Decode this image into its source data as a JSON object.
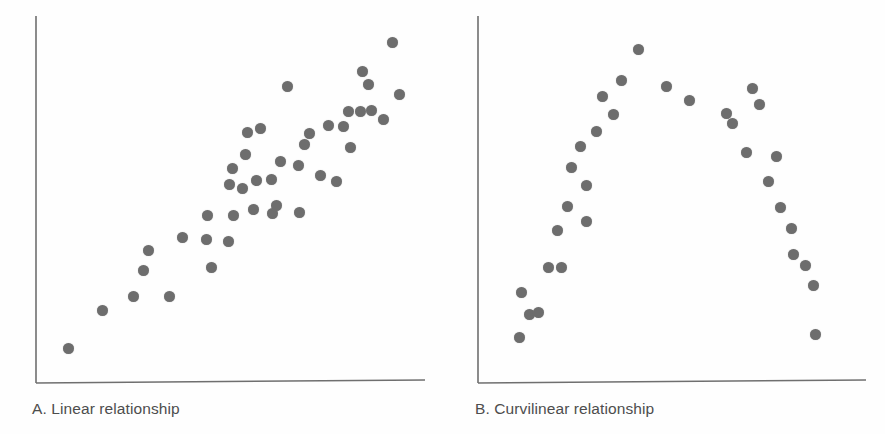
{
  "figure": {
    "background_color": "#fefefe",
    "dot_color": "#6d6d6d",
    "axis_color": "#6f6f6f",
    "caption_color": "#4d4d4d"
  },
  "panels": [
    {
      "id": "A",
      "caption": "A. Linear relationship",
      "axes": {
        "origin_x": 36,
        "origin_y": 383,
        "top_y": 16,
        "right_x": 425
      }
    },
    {
      "id": "B",
      "caption": "B. Curvilinear relationship",
      "axes": {
        "origin_x": 35,
        "origin_y": 383,
        "top_y": 16,
        "right_x": 423
      }
    }
  ],
  "chart_data": [
    {
      "type": "scatter",
      "title": "A. Linear relationship",
      "xlabel": "",
      "ylabel": "",
      "grid": false,
      "legend": "none",
      "axis_ticks": [],
      "xlim": [
        0,
        1
      ],
      "ylim": [
        0,
        1
      ],
      "series": [
        {
          "name": "observations",
          "marker": "circle",
          "color": "#6d6d6d",
          "points": [
            [
              0.051,
              0.049
            ],
            [
              0.144,
              0.163
            ],
            [
              0.231,
              0.202
            ],
            [
              0.257,
              0.281
            ],
            [
              0.27,
              0.341
            ],
            [
              0.329,
              0.202
            ],
            [
              0.366,
              0.377
            ],
            [
              0.432,
              0.371
            ],
            [
              0.435,
              0.445
            ],
            [
              0.444,
              0.288
            ],
            [
              0.491,
              0.366
            ],
            [
              0.494,
              0.537
            ],
            [
              0.504,
              0.582
            ],
            [
              0.506,
              0.445
            ],
            [
              0.53,
              0.523
            ],
            [
              0.539,
              0.626
            ],
            [
              0.544,
              0.689
            ],
            [
              0.56,
              0.46
            ],
            [
              0.57,
              0.548
            ],
            [
              0.58,
              0.701
            ],
            [
              0.609,
              0.551
            ],
            [
              0.612,
              0.449
            ],
            [
              0.624,
              0.474
            ],
            [
              0.636,
              0.603
            ],
            [
              0.653,
              0.826
            ],
            [
              0.685,
              0.592
            ],
            [
              0.686,
              0.453
            ],
            [
              0.702,
              0.653
            ],
            [
              0.714,
              0.688
            ],
            [
              0.746,
              0.563
            ],
            [
              0.767,
              0.71
            ],
            [
              0.789,
              0.545
            ],
            [
              0.808,
              0.707
            ],
            [
              0.821,
              0.752
            ],
            [
              0.827,
              0.645
            ],
            [
              0.854,
              0.753
            ],
            [
              0.862,
              0.872
            ],
            [
              0.877,
              0.831
            ],
            [
              0.885,
              0.755
            ],
            [
              0.92,
              0.729
            ],
            [
              0.943,
              0.958
            ],
            [
              0.964,
              0.804
            ]
          ]
        }
      ]
    },
    {
      "type": "scatter",
      "title": "B. Curvilinear relationship",
      "xlabel": "",
      "ylabel": "",
      "grid": false,
      "legend": "none",
      "axis_ticks": [],
      "xlim": [
        0,
        1
      ],
      "ylim": [
        0,
        1
      ],
      "series": [
        {
          "name": "observations",
          "marker": "circle",
          "color": "#6d6d6d",
          "points": [
            [
              0.075,
              0.082
            ],
            [
              0.081,
              0.214
            ],
            [
              0.104,
              0.15
            ],
            [
              0.129,
              0.155
            ],
            [
              0.155,
              0.289
            ],
            [
              0.18,
              0.4
            ],
            [
              0.192,
              0.289
            ],
            [
              0.209,
              0.47
            ],
            [
              0.219,
              0.586
            ],
            [
              0.245,
              0.649
            ],
            [
              0.26,
              0.533
            ],
            [
              0.262,
              0.425
            ],
            [
              0.29,
              0.692
            ],
            [
              0.305,
              0.798
            ],
            [
              0.335,
              0.743
            ],
            [
              0.358,
              0.845
            ],
            [
              0.404,
              0.936
            ],
            [
              0.483,
              0.827
            ],
            [
              0.545,
              0.786
            ],
            [
              0.649,
              0.745
            ],
            [
              0.665,
              0.716
            ],
            [
              0.703,
              0.63
            ],
            [
              0.719,
              0.82
            ],
            [
              0.738,
              0.772
            ],
            [
              0.763,
              0.545
            ],
            [
              0.785,
              0.618
            ],
            [
              0.796,
              0.467
            ],
            [
              0.826,
              0.405
            ],
            [
              0.834,
              0.327
            ],
            [
              0.867,
              0.296
            ],
            [
              0.887,
              0.235
            ],
            [
              0.894,
              0.09
            ]
          ]
        }
      ]
    }
  ]
}
